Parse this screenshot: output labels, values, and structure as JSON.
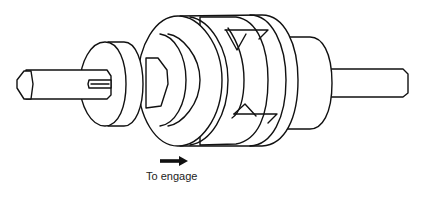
{
  "diagram": {
    "parts": [
      {
        "name": "left-shaft",
        "shape": "hexagonal-end shaft"
      },
      {
        "name": "key",
        "shape": "keyway slot on shaft"
      },
      {
        "name": "left-collar",
        "shape": "disc"
      },
      {
        "name": "hex-nut",
        "shape": "hexagonal hub"
      },
      {
        "name": "sliding-dog-member",
        "shape": "stepped cylinder"
      },
      {
        "name": "clutch-dogs",
        "shape": "interlocking triangular teeth"
      },
      {
        "name": "fixed-dog-member",
        "shape": "cylinder"
      },
      {
        "name": "right-hub",
        "shape": "disc"
      },
      {
        "name": "right-shaft",
        "shape": "round shaft"
      }
    ],
    "annotation": {
      "arrow_direction": "right",
      "label": "To engage"
    },
    "colors": {
      "line": "#111111",
      "background": "#ffffff"
    }
  }
}
